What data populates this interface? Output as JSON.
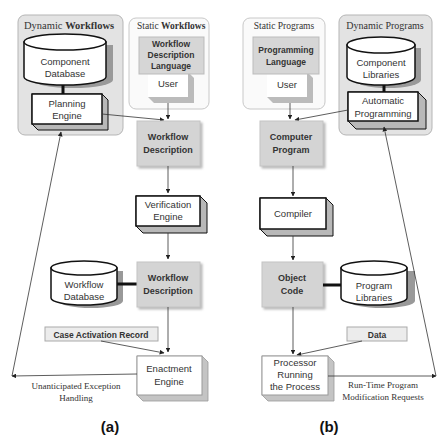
{
  "panel_a": {
    "caption": "(a)",
    "dynamic_group": {
      "title_part1": "Dynamic ",
      "title_part2": "Workflows",
      "database": {
        "line1": "Component",
        "line2": "Database"
      },
      "engine": {
        "line1": "Planning",
        "line2": "Engine"
      }
    },
    "static_group": {
      "title_part1": "Static ",
      "title_part2": "Workflows",
      "language": {
        "line1": "Workflow",
        "line2": "Description",
        "line3": "Language"
      },
      "user": "User"
    },
    "workflow_description_1": {
      "line1": "Workflow",
      "line2": "Description"
    },
    "verification_engine": {
      "line1": "Verification",
      "line2": "Engine"
    },
    "workflow_database": {
      "line1": "Workflow",
      "line2": "Database"
    },
    "workflow_description_2": {
      "line1": "Workflow",
      "line2": "Description"
    },
    "case_activation_record": "Case Activation Record",
    "enactment_engine": {
      "line1": "Enactment",
      "line2": "Engine"
    },
    "exception_label": {
      "line1": "Unanticipated Exception",
      "line2": "Handling"
    }
  },
  "panel_b": {
    "caption": "(b)",
    "static_group": {
      "title": "Static Programs",
      "language": {
        "line1": "Programming",
        "line2": "Language"
      },
      "user": "User"
    },
    "dynamic_group": {
      "title": "Dynamic Programs",
      "libraries": {
        "line1": "Component",
        "line2": "Libraries"
      },
      "automatic": {
        "line1": "Automatic",
        "line2": "Programming"
      }
    },
    "computer_program": {
      "line1": "Computer",
      "line2": "Program"
    },
    "compiler": "Compiler",
    "object_code": {
      "line1": "Object",
      "line2": "Code"
    },
    "program_libraries": {
      "line1": "Program",
      "line2": "Libraries"
    },
    "data": "Data",
    "processor": {
      "line1": "Processor",
      "line2": "Running",
      "line3": "the Process"
    },
    "modification_label": {
      "line1": "Run-Time Program",
      "line2": "Modification Requests"
    }
  },
  "colors": {
    "group_fill": "#e6e6e6",
    "group_stroke": "#b0b0b0",
    "gray_box": "#d4d4d4",
    "light_box": "#ececec",
    "shadow": "#a8a8a8",
    "line": "#333333"
  }
}
